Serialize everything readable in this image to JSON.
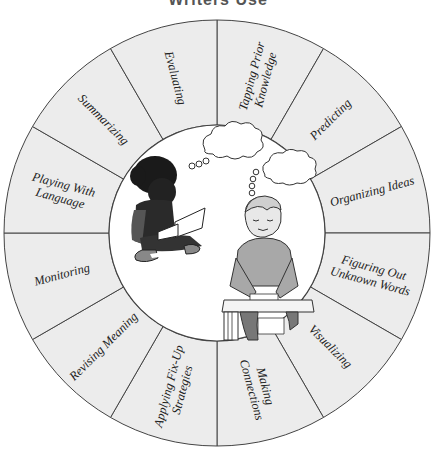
{
  "title": "Writers Use",
  "wheel": {
    "center": [
      217,
      233
    ],
    "outer_radius": 213,
    "inner_radius": 108,
    "fill_color": "#ececec",
    "stroke_color": "#444444",
    "segments": [
      {
        "label_lines": [
          "Tapping Prior",
          "Knowledge"
        ]
      },
      {
        "label_lines": [
          "Predicting"
        ]
      },
      {
        "label_lines": [
          "Organizing Ideas"
        ]
      },
      {
        "label_lines": [
          "Figuring Out",
          "Unknown Words"
        ]
      },
      {
        "label_lines": [
          "Visualizing"
        ]
      },
      {
        "label_lines": [
          "Making",
          "Connections"
        ]
      },
      {
        "label_lines": [
          "Applying Fix-Up",
          "Strategies"
        ]
      },
      {
        "label_lines": [
          "Revising Meaning"
        ]
      },
      {
        "label_lines": [
          "Monitoring"
        ]
      },
      {
        "label_lines": [
          "Playing With",
          "Language"
        ]
      },
      {
        "label_lines": [
          "Summarizing"
        ]
      },
      {
        "label_lines": [
          "Evaluating"
        ]
      }
    ]
  },
  "center_illustration": {
    "figures": [
      "girl-reading-book-icon",
      "boy-writing-at-desk-icon"
    ],
    "thought_bubbles": 2
  }
}
